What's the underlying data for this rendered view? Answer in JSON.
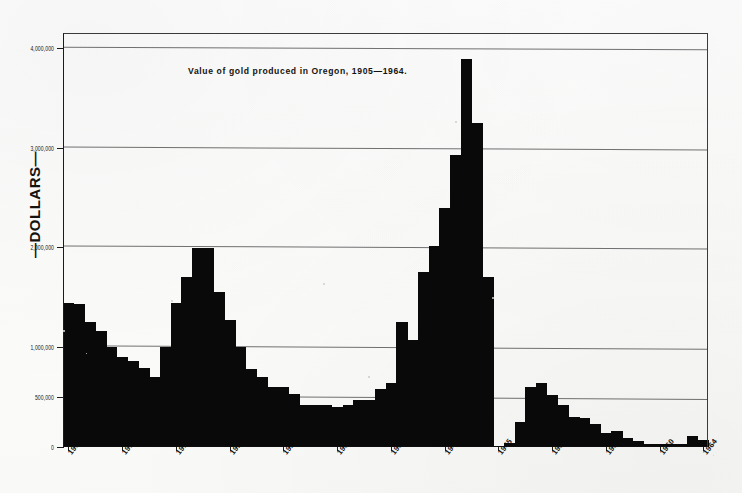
{
  "figure": {
    "title": "Value of gold produced in Oregon, 1905—1964.",
    "ylabel": "—DOLLARS—"
  },
  "chart_data": {
    "type": "bar",
    "title": "Value of gold produced in Oregon, 1905—1964.",
    "xlabel": "",
    "ylabel": "—DOLLARS—",
    "ylim": [
      0,
      4150000
    ],
    "xlim": [
      1904.5,
      1964.5
    ],
    "grid": true,
    "legend": "none",
    "y_ticks": [
      {
        "value": 4000000,
        "label": "4,000,000"
      },
      {
        "value": 3000000,
        "label": "3,000,000"
      },
      {
        "value": 2000000,
        "label": "2,000,000"
      },
      {
        "value": 1000000,
        "label": "1,000,000"
      },
      {
        "value": 500000,
        "label": "500,000"
      },
      {
        "value": 0,
        "label": "0"
      }
    ],
    "x_ticks": [
      "1905",
      "1910",
      "1915",
      "1920",
      "1925",
      "1930",
      "1935",
      "1940",
      "1945",
      "1950",
      "1955",
      "1960",
      "1964"
    ],
    "units": "US dollars",
    "categories": [
      1905,
      1906,
      1907,
      1908,
      1909,
      1910,
      1911,
      1912,
      1913,
      1914,
      1915,
      1916,
      1917,
      1918,
      1919,
      1920,
      1921,
      1922,
      1923,
      1924,
      1925,
      1926,
      1927,
      1928,
      1929,
      1930,
      1931,
      1932,
      1933,
      1934,
      1935,
      1936,
      1937,
      1938,
      1939,
      1940,
      1941,
      1942,
      1943,
      1944,
      1945,
      1946,
      1947,
      1948,
      1949,
      1950,
      1951,
      1952,
      1953,
      1954,
      1955,
      1956,
      1957,
      1958,
      1959,
      1960,
      1961,
      1962,
      1963,
      1964
    ],
    "values": [
      1440000,
      1430000,
      1250000,
      1160000,
      1000000,
      900000,
      860000,
      790000,
      700000,
      1000000,
      1440000,
      1700000,
      1990000,
      1990000,
      1550000,
      1270000,
      1000000,
      780000,
      700000,
      600000,
      600000,
      530000,
      420000,
      420000,
      420000,
      400000,
      420000,
      470000,
      470000,
      580000,
      640000,
      1250000,
      1070000,
      1750000,
      2020000,
      2400000,
      2930000,
      3890000,
      3250000,
      1700000,
      0,
      40000,
      250000,
      600000,
      640000,
      520000,
      420000,
      300000,
      290000,
      230000,
      140000,
      160000,
      90000,
      60000,
      30000,
      30000,
      30000,
      30000,
      110000,
      70000
    ]
  }
}
